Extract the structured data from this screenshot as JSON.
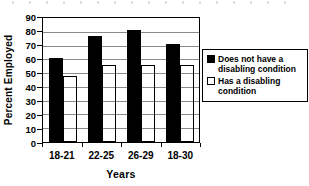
{
  "chart_data": {
    "type": "bar",
    "title": "",
    "categories": [
      "18-21",
      "22-25",
      "26-29",
      "18-30"
    ],
    "series": [
      {
        "name": "Does not have a disabling condition",
        "fill": "#000000",
        "border": "#000000",
        "values": [
          61,
          77,
          81,
          71
        ]
      },
      {
        "name": "Has a disabling condition",
        "fill": "#ffffff",
        "border": "#000000",
        "values": [
          48,
          56,
          56,
          56
        ]
      }
    ],
    "xlabel": "Years",
    "ylabel": "Percent Employed",
    "ylim": [
      0,
      90
    ],
    "yticks": [
      0,
      10,
      20,
      30,
      40,
      50,
      60,
      70,
      80,
      90
    ],
    "grid": "horizontal-only",
    "gridline_color": "#8a8a8a",
    "axis_color": "#000000",
    "text_color": "#000000",
    "background": "#ffffff",
    "legend_position": "right",
    "bar_width_px": 14
  }
}
